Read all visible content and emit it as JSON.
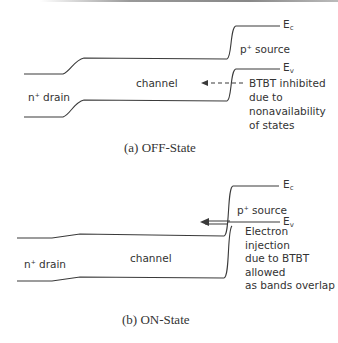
{
  "off_state": {
    "caption": "(a) OFF-State",
    "ec_label": "E",
    "ec_sub": "c",
    "ev_label": "E",
    "ev_sub": "v",
    "source_label_sup": "+",
    "source_label_p": "p",
    "source_label": " source",
    "drain_label_n": "n",
    "drain_label_sup": "+",
    "drain_label": " drain",
    "channel_label": "channel",
    "annotation": [
      "BTBT inhibited",
      "due to",
      "nonavailability",
      "of states"
    ]
  },
  "on_state": {
    "caption": "(b) ON-State",
    "ec_label": "E",
    "ec_sub": "c",
    "ev_label": "E",
    "ev_sub": "v",
    "source_label_p": "p",
    "source_label_sup": "+",
    "source_label": " source",
    "drain_label_n": "n",
    "drain_label_sup": "+",
    "drain_label": " drain",
    "channel_label": "channel",
    "annotation": [
      "Electron",
      "injection",
      "due to BTBT",
      "allowed",
      "as bands overlap"
    ]
  },
  "colors": {
    "line": "#3a3a3a",
    "text": "#333333"
  }
}
